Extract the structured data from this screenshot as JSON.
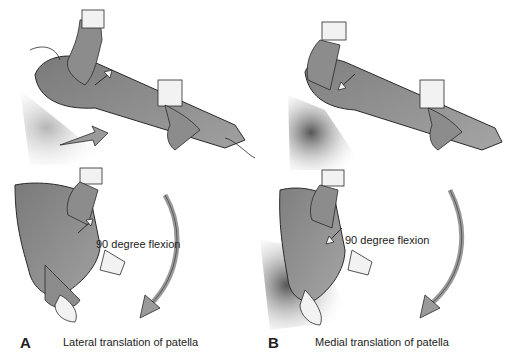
{
  "figure": {
    "colors": {
      "skin": "#8a8a8a",
      "skin_dark": "#6b6b6b",
      "glove": "#f2f2f2",
      "outline": "#2a2a2a",
      "arrow_fill": "#9a9a9a",
      "shadow": "#c8c8c8"
    },
    "panels": [
      {
        "letter": "A",
        "caption": "Lateral translation of patella",
        "flexion_label": "90 degree flexion",
        "direction": "lateral"
      },
      {
        "letter": "B",
        "caption": "Medial translation of patella",
        "flexion_label": "90 degree flexion",
        "direction": "medial"
      }
    ]
  }
}
